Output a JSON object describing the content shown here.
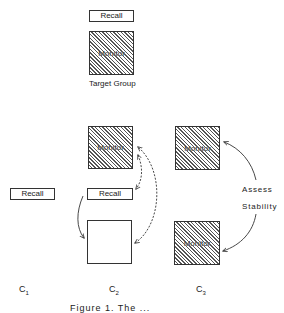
{
  "diagram": {
    "target_group": {
      "recall_label": "Recall",
      "monitor_label": "Monitor",
      "caption": "Target Group"
    },
    "c2": {
      "monitor_label": "Monitor",
      "recall_label": "Recall",
      "empty_box_label": ""
    },
    "c1": {
      "recall_label": "Recall"
    },
    "c3": {
      "monitor_top_label": "Monitor",
      "monitor_bottom_label": "Monitor",
      "annotation_line1": "Assess",
      "annotation_line2": "Stability"
    },
    "conditions": [
      {
        "base": "C",
        "sub": "1"
      },
      {
        "base": "C",
        "sub": "2"
      },
      {
        "base": "C",
        "sub": "3"
      }
    ],
    "figure_caption": "Figure 1.  The ..."
  }
}
